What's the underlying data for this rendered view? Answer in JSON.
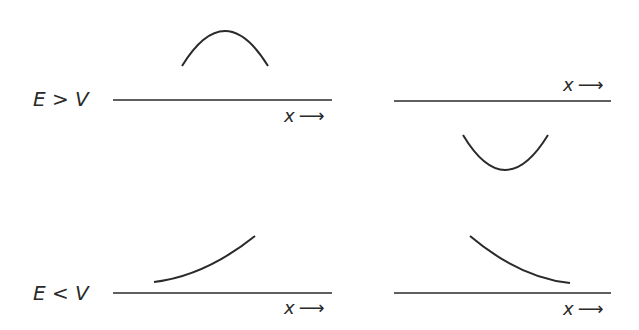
{
  "diagram": {
    "rows": [
      {
        "label": "E > V"
      },
      {
        "label": "E < V"
      }
    ],
    "axis_label": "x",
    "arrow": "⟶",
    "panels": [
      {
        "id": "top-left",
        "row": "E > V",
        "curve": "concave-down arc (oscillatory)"
      },
      {
        "id": "top-right",
        "row": "E > V",
        "curve": "concave-up arc (oscillatory)"
      },
      {
        "id": "bottom-left",
        "row": "E < V",
        "curve": "exponentially increasing"
      },
      {
        "id": "bottom-right",
        "row": "E < V",
        "curve": "exponentially decreasing"
      }
    ],
    "stroke_color": "#2a2a2a"
  }
}
